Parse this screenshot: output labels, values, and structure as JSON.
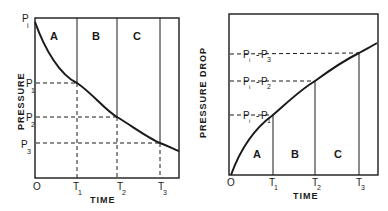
{
  "figure": {
    "background": "#ffffff",
    "ink_color": "#1a1a1a"
  },
  "left_chart": {
    "ylabel": "PRESSURE",
    "xlabel": "TIME",
    "origin_label": "O",
    "top_label_main": "P",
    "top_label_sub": "i",
    "x_ticks": [
      {
        "main": "T",
        "sub": "1"
      },
      {
        "main": "T",
        "sub": "2"
      },
      {
        "main": "T",
        "sub": "3"
      }
    ],
    "y_ticks": [
      {
        "main": "P",
        "sub": "1"
      },
      {
        "main": "P",
        "sub": "2"
      },
      {
        "main": "P",
        "sub": "3"
      }
    ],
    "regions": [
      "A",
      "B",
      "C"
    ]
  },
  "right_chart": {
    "ylabel": "PRESSURE DROP",
    "xlabel": "TIME",
    "origin_label": "O",
    "x_ticks": [
      {
        "main": "T",
        "sub": "1"
      },
      {
        "main": "T",
        "sub": "2"
      },
      {
        "main": "T",
        "sub": "3"
      }
    ],
    "y_ticks": [
      {
        "a": "P",
        "asub": "i",
        "dash": "-",
        "b": "P",
        "bsub": "1"
      },
      {
        "a": "P",
        "asub": "i",
        "dash": "-",
        "b": "P",
        "bsub": "2"
      },
      {
        "a": "P",
        "asub": "i",
        "dash": "-",
        "b": "P",
        "bsub": "3"
      }
    ],
    "regions": [
      "A",
      "B",
      "C"
    ]
  }
}
